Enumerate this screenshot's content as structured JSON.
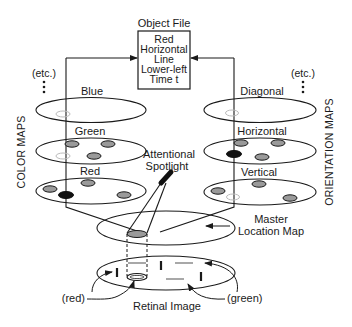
{
  "diagram": {
    "object_file": {
      "title": "Object File",
      "lines": [
        "Red",
        "Horizontal",
        "Line",
        "Lower-left",
        "Time t"
      ]
    },
    "left_group": {
      "side_label": "COLOR MAPS",
      "etc_label": "(etc.)",
      "maps": [
        {
          "label": "Blue"
        },
        {
          "label": "Green"
        },
        {
          "label": "Red"
        }
      ]
    },
    "right_group": {
      "side_label": "ORIENTATION MAPS",
      "etc_label": "(etc.)",
      "maps": [
        {
          "label": "Diagonal"
        },
        {
          "label": "Horizontal"
        },
        {
          "label": "Vertical"
        }
      ]
    },
    "spotlight": {
      "label_line1": "Attentional",
      "label_line2": "Spotlight"
    },
    "master_map": {
      "label_line1": "Master",
      "label_line2": "Location Map"
    },
    "retinal": {
      "label": "Retinal Image",
      "red_annotation": "(red)",
      "green_annotation": "(green)"
    },
    "colors": {
      "ink": "#1a1a1a",
      "feature_gray": "#9a9a9a",
      "active_black": "#111111",
      "ghost_outline": "#bdbdbd",
      "green_bar": "#a8a8a8"
    }
  }
}
